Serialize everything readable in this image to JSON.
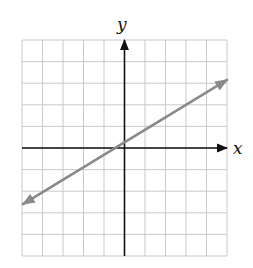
{
  "chart_data": {
    "type": "line",
    "title": "",
    "xlabel": "x",
    "ylabel": "y",
    "xlim": [
      -5,
      5
    ],
    "ylim": [
      -5,
      5
    ],
    "grid": true,
    "grid_step": 1,
    "tick_labels": false,
    "legend": null,
    "series": [
      {
        "name": "line",
        "equation_estimate": "y ≈ 0.58x + 0.25",
        "slope": 0.58,
        "y_intercept": 0.25,
        "x_intercept": -0.4,
        "x": [
          -4.95,
          5.0
        ],
        "y": [
          -2.6,
          3.15
        ],
        "arrows_both_ends": true
      }
    ]
  },
  "colors": {
    "grid": "#c9c9c9",
    "axis": "#111111",
    "line": "#8a8a8a"
  },
  "labels": {
    "x_axis": "x",
    "y_axis": "y"
  }
}
